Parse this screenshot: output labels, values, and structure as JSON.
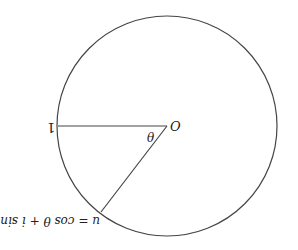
{
  "diagram": {
    "type": "unit-circle",
    "labels": {
      "origin": "O",
      "angle": "θ",
      "one": "1",
      "point_u": "u = cos θ + i sin θ"
    },
    "geometry": {
      "center": [
        167,
        126
      ],
      "radius": 110,
      "one_point": [
        58,
        126
      ],
      "u_point": [
        101,
        212
      ]
    },
    "orientation_note": "rendered rotated 180°",
    "colors": {
      "stroke": "#444444",
      "text": "#222222",
      "background": "#ffffff"
    }
  }
}
